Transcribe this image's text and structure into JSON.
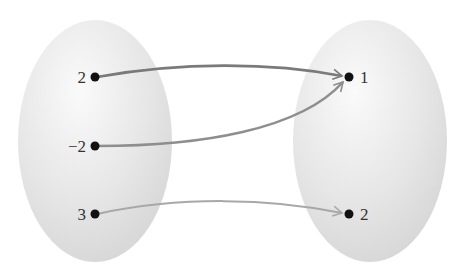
{
  "diagram": {
    "type": "mapping",
    "domain_set": {
      "elements": [
        "2",
        "−2",
        "3"
      ]
    },
    "range_set": {
      "elements": [
        "1",
        "2"
      ]
    },
    "arrows": [
      {
        "from": "2",
        "to": "1"
      },
      {
        "from": "−2",
        "to": "1"
      },
      {
        "from": "3",
        "to": "2"
      }
    ],
    "colors": {
      "ellipse": "#e4e4e4",
      "arrow_top": "#7a7a7a",
      "arrow_mid": "#8e8e8e",
      "arrow_bottom": "#a8a8a8",
      "dot": "#111111"
    }
  }
}
